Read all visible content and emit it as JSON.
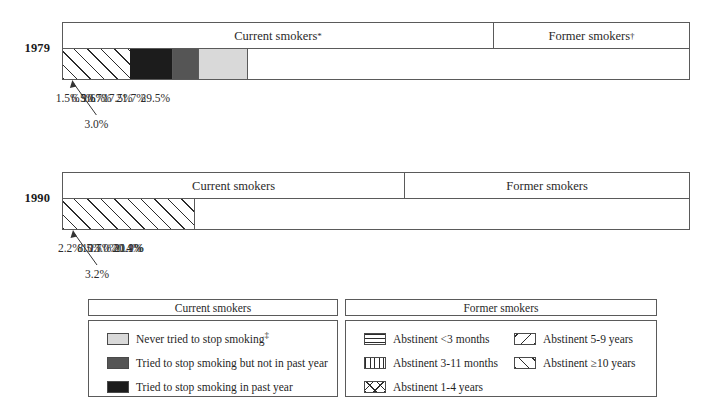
{
  "chart_data": {
    "type": "bar",
    "orientation": "horizontal-stacked",
    "title": "",
    "xlabel": "",
    "ylabel": "",
    "categories": [
      "1979",
      "1990"
    ],
    "group_headers": {
      "current": "Current smokers",
      "former": "Former smokers",
      "current_sup_1979": "*",
      "former_sup_1979": "†"
    },
    "series": [
      {
        "name": "Never tried to stop smoking",
        "pattern": "solid-light",
        "values": [
          29.5,
          20.4
        ]
      },
      {
        "name": "Tried to stop smoking but not in past year",
        "pattern": "solid-mid",
        "values": [
          21.7,
          21.1
        ]
      },
      {
        "name": "Tried to stop smoking in past year",
        "pattern": "solid-dark",
        "values": [
          17.5,
          13.0
        ]
      },
      {
        "name": "Abstinent <3 months",
        "pattern": "horizontal-lines",
        "values": [
          1.5,
          2.2
        ]
      },
      {
        "name": "Abstinent 3-11 months",
        "pattern": "vertical-lines",
        "values": [
          3.0,
          3.2
        ]
      },
      {
        "name": "Abstinent 1-4 years",
        "pattern": "cross-hatch",
        "values": [
          9.6,
          10.7
        ]
      },
      {
        "name": "Abstinent 5-9 years",
        "pattern": "diagonal-left",
        "values": [
          6.5,
          8.5
        ]
      },
      {
        "name": "Abstinent ≥10 years",
        "pattern": "diagonal-right",
        "values": [
          10.7,
          20.9
        ]
      }
    ],
    "ylim": [
      0,
      100
    ],
    "grid": false,
    "legend_position": "bottom"
  },
  "bars": [
    {
      "year": "1979",
      "current_header": "Current smokers",
      "current_header_sup": "*",
      "former_header": "Former smokers",
      "former_header_sup": "†",
      "segments": [
        {
          "label": "29.5%",
          "value": 29.5,
          "fill": "f-light",
          "show_label": true,
          "callout": false
        },
        {
          "label": "21.7%",
          "value": 21.7,
          "fill": "f-mid",
          "show_label": true,
          "callout": false
        },
        {
          "label": "17.5%",
          "value": 17.5,
          "fill": "f-dark",
          "show_label": true,
          "callout": false
        },
        {
          "label": "1.5%",
          "value": 1.5,
          "fill": "f-horz",
          "show_label": true,
          "callout": false
        },
        {
          "label": "3.0%",
          "value": 3.0,
          "fill": "f-vert",
          "show_label": false,
          "callout": true
        },
        {
          "label": "9.6%",
          "value": 9.6,
          "fill": "f-cross",
          "show_label": true,
          "callout": false
        },
        {
          "label": "6.5%",
          "value": 6.5,
          "fill": "f-diagL",
          "show_label": true,
          "callout": false
        },
        {
          "label": "10.7%",
          "value": 10.7,
          "fill": "f-diagR",
          "show_label": true,
          "callout": false
        }
      ]
    },
    {
      "year": "1990",
      "current_header": "Current smokers",
      "current_header_sup": "",
      "former_header": "Former smokers",
      "former_header_sup": "",
      "segments": [
        {
          "label": "20.4%",
          "value": 20.4,
          "fill": "f-light",
          "show_label": true,
          "callout": false
        },
        {
          "label": "21.1%",
          "value": 21.1,
          "fill": "f-mid",
          "show_label": true,
          "callout": false
        },
        {
          "label": "13.0%",
          "value": 13.0,
          "fill": "f-dark",
          "show_label": true,
          "callout": false
        },
        {
          "label": "2.2%",
          "value": 2.2,
          "fill": "f-horz",
          "show_label": true,
          "callout": false
        },
        {
          "label": "3.2%",
          "value": 3.2,
          "fill": "f-vert",
          "show_label": false,
          "callout": true
        },
        {
          "label": "10.7%",
          "value": 10.7,
          "fill": "f-cross",
          "show_label": true,
          "callout": false
        },
        {
          "label": "8.5%",
          "value": 8.5,
          "fill": "f-diagL",
          "show_label": true,
          "callout": false
        },
        {
          "label": "20.9%",
          "value": 20.9,
          "fill": "f-diagR",
          "show_label": true,
          "callout": false
        }
      ]
    }
  ],
  "legend_left": {
    "title": "Current smokers",
    "items": [
      {
        "label": "Never tried to stop smoking",
        "sup": "‡",
        "fill": "f-light"
      },
      {
        "label": "Tried to stop smoking but not in past year",
        "sup": "",
        "fill": "f-mid"
      },
      {
        "label": "Tried to stop smoking in past year",
        "sup": "",
        "fill": "f-dark"
      }
    ]
  },
  "legend_right": {
    "title": "Former smokers",
    "items_col1": [
      {
        "label": "Abstinent <3 months",
        "fill": "f-horz"
      },
      {
        "label": "Abstinent 3-11 months",
        "fill": "f-vert"
      },
      {
        "label": "Abstinent 1-4 years",
        "fill": "f-cross"
      }
    ],
    "items_col2": [
      {
        "label": "Abstinent 5-9 years",
        "fill": "f-diagL"
      },
      {
        "label": "Abstinent ≥10 years",
        "fill": "f-diagR"
      }
    ]
  },
  "colors": {
    "light": "#d9d9d9",
    "mid": "#555555",
    "dark": "#1c1c1c",
    "line": "#5a5a5a",
    "text": "#1a1a1a"
  }
}
